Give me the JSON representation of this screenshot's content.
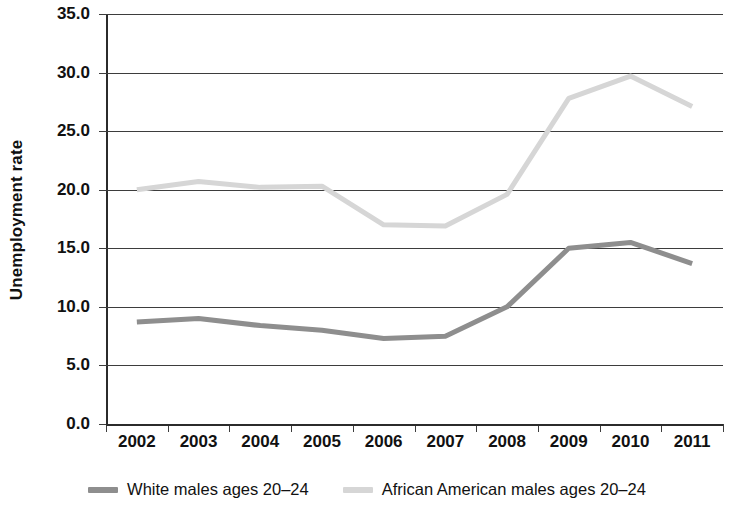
{
  "chart_data": {
    "type": "line",
    "title": "",
    "xlabel": "",
    "ylabel": "Unemployment rate",
    "categories": [
      "2002",
      "2003",
      "2004",
      "2005",
      "2006",
      "2007",
      "2008",
      "2009",
      "2010",
      "2011"
    ],
    "ylim": [
      0.0,
      35.0
    ],
    "ytick_step": 5.0,
    "yticks": [
      "0.0",
      "5.0",
      "10.0",
      "15.0",
      "20.0",
      "25.0",
      "30.0",
      "35.0"
    ],
    "ytick_values": [
      0.0,
      5.0,
      10.0,
      15.0,
      20.0,
      25.0,
      30.0,
      35.0
    ],
    "grid": "horizontal",
    "legend_position": "bottom",
    "series": [
      {
        "name": "White males ages 20–24",
        "color": "#8e8e8e",
        "values": [
          8.7,
          9.0,
          8.4,
          8.0,
          7.3,
          7.5,
          10.0,
          15.0,
          15.5,
          13.7
        ]
      },
      {
        "name": "African American males ages 20–24",
        "color": "#d6d6d6",
        "values": [
          20.0,
          20.7,
          20.2,
          20.3,
          17.0,
          16.9,
          19.6,
          27.8,
          29.7,
          27.1
        ]
      }
    ]
  },
  "legend": {
    "items": [
      {
        "label": "White males ages 20–24"
      },
      {
        "label": "African American males ages 20–24"
      }
    ]
  },
  "axis": {
    "y_title": "Unemployment rate"
  }
}
